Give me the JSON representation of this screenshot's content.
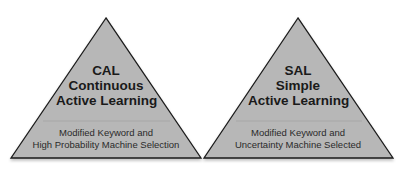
{
  "colors": {
    "triangle_fill": "#b7b7b7",
    "triangle_stroke": "#1a1a1a",
    "divider": "#9e9e9e",
    "text": "#1a1a1a",
    "background": "#ffffff"
  },
  "triangles": [
    {
      "id": "cal",
      "title_lines": [
        "CAL",
        "Continuous",
        "Active Learning"
      ],
      "subtitle_lines": [
        "Modified Keyword and",
        "High Probability Machine Selection"
      ]
    },
    {
      "id": "sal",
      "title_lines": [
        "SAL",
        "Simple",
        "Active Learning"
      ],
      "subtitle_lines": [
        "Modified Keyword and",
        "Uncertainty Machine Selected"
      ]
    }
  ]
}
